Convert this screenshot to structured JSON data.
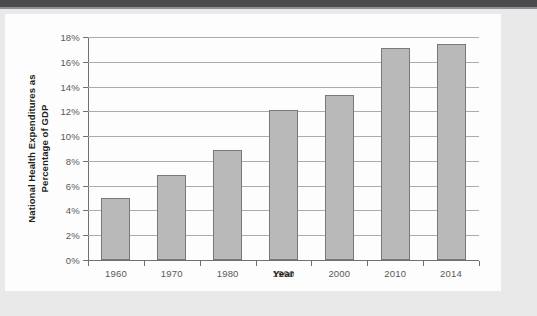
{
  "page": {
    "background_color": "#e9e9ea",
    "card_color": "#fdfdfd",
    "top_band_color": "#4a4a4c"
  },
  "chart_data": {
    "type": "bar",
    "title": "",
    "categories": [
      "1960",
      "1970",
      "1980",
      "1990",
      "2000",
      "2010",
      "2014"
    ],
    "values": [
      5.0,
      6.9,
      8.9,
      12.1,
      13.3,
      17.1,
      17.4
    ],
    "xlabel": "Year",
    "ylabel": "National Health Expenditures as Percentage of GDP",
    "ylabel_line1": "National Health Expenditures as",
    "ylabel_line2": "Percentage of GDP",
    "ylim": [
      0,
      18
    ],
    "ytick_values": [
      0,
      2,
      4,
      6,
      8,
      10,
      12,
      14,
      16,
      18
    ],
    "ytick_labels": [
      "0%",
      "2%",
      "4%",
      "6%",
      "8%",
      "10%",
      "12%",
      "14%",
      "16%",
      "18%"
    ],
    "grid": true,
    "legend": null,
    "bar_fill_color": "#b9b9ba",
    "bar_border_color": "#77797c",
    "gridline_color": "#a9abae",
    "axis_color": "#6e7073",
    "tick_label_color": "#58595b",
    "axis_title_color": "#231f20"
  }
}
